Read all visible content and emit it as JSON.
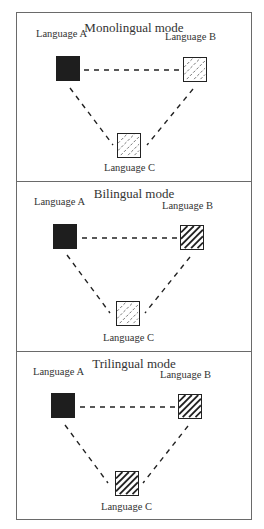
{
  "panels": [
    {
      "title": "Monolingual mode",
      "nodes": {
        "a": {
          "label": "Language A",
          "fill": "solid"
        },
        "b": {
          "label": "Language B",
          "fill": "light-hatch"
        },
        "c": {
          "label": "Language C",
          "fill": "light-hatch"
        }
      }
    },
    {
      "title": "Bilingual mode",
      "nodes": {
        "a": {
          "label": "Language A",
          "fill": "solid"
        },
        "b": {
          "label": "Language B",
          "fill": "bold-hatch"
        },
        "c": {
          "label": "Language C",
          "fill": "light-hatch"
        }
      }
    },
    {
      "title": "Trilingual mode",
      "nodes": {
        "a": {
          "label": "Language A",
          "fill": "solid"
        },
        "b": {
          "label": "Language B",
          "fill": "bold-hatch"
        },
        "c": {
          "label": "Language C",
          "fill": "bold-hatch"
        }
      }
    }
  ],
  "edges": [
    "A-B dashed",
    "A-C dashed",
    "B-C dashed"
  ],
  "colors": {
    "solid": "#1e1e1e",
    "border": "#6a6a6a",
    "line": "#222222"
  }
}
